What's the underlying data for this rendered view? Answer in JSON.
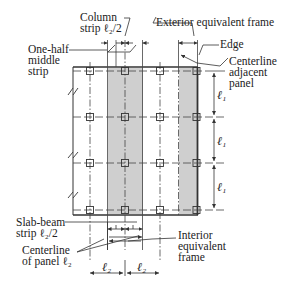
{
  "labels": {
    "column_strip": [
      "Column",
      "strip ℓ₂/2"
    ],
    "exterior_frame": "Exterior equivalent frame",
    "one_half_middle": [
      "One-half",
      "middle",
      "strip"
    ],
    "edge": "Edge",
    "centerline_adjacent": [
      "Centerline",
      "adjacent",
      "panel"
    ],
    "slab_beam": [
      "Slab-beam",
      "strip ℓ₂/2"
    ],
    "centerline_panel": [
      "Centerline",
      "of panel ℓ₂"
    ],
    "interior_frame": [
      "Interior",
      "equivalent",
      "frame"
    ]
  },
  "dimensions": {
    "l1": [
      "ℓ₁",
      "ℓ₁",
      "ℓ₁"
    ],
    "l2": [
      "ℓ₂",
      "ℓ₂"
    ]
  },
  "colors": {
    "shade": "#cfcfcf",
    "line": "#333333"
  }
}
